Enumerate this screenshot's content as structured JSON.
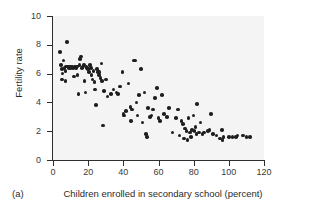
{
  "figure": {
    "panel_label": "(a)",
    "background_color": "#ffffff",
    "plot_background_color": "#f4f4f4",
    "marker_color": "#1f1f1f",
    "axis_color": "#2e2e2e"
  },
  "chart_data": {
    "type": "scatter",
    "title": "",
    "xlabel": "Children enrolled in secondary school (percent)",
    "ylabel": "Fertility rate",
    "xlim": [
      0,
      120
    ],
    "ylim": [
      0,
      10
    ],
    "xticks": [
      0,
      20,
      40,
      60,
      80,
      100,
      120
    ],
    "yticks": [
      0,
      2,
      4,
      6,
      8,
      10
    ],
    "xtick_labels": [
      "0",
      "20",
      "40",
      "60",
      "80",
      "100",
      "120"
    ],
    "ytick_labels": [
      "0",
      "2",
      "4",
      "6",
      "8",
      "10"
    ],
    "grid": false,
    "legend": "none",
    "series": [
      {
        "name": "Countries",
        "points": [
          [
            4.0,
            7.5
          ],
          [
            4.5,
            6.6
          ],
          [
            5.0,
            6.3
          ],
          [
            5.2,
            5.6
          ],
          [
            5.5,
            6.0
          ],
          [
            6.0,
            6.9
          ],
          [
            6.5,
            6.4
          ],
          [
            7.0,
            6.2
          ],
          [
            7.2,
            5.5
          ],
          [
            7.5,
            6.5
          ],
          [
            8.0,
            8.2
          ],
          [
            8.5,
            6.5
          ],
          [
            9.0,
            6.4
          ],
          [
            9.5,
            6.5
          ],
          [
            10.0,
            6.4
          ],
          [
            10.5,
            6.5
          ],
          [
            11.0,
            6.5
          ],
          [
            11.5,
            6.4
          ],
          [
            12.0,
            5.8
          ],
          [
            12.5,
            6.5
          ],
          [
            13.0,
            6.4
          ],
          [
            13.5,
            6.5
          ],
          [
            14.0,
            5.9
          ],
          [
            14.5,
            4.6
          ],
          [
            15.0,
            6.6
          ],
          [
            15.5,
            7.0
          ],
          [
            16.0,
            7.2
          ],
          [
            16.5,
            6.4
          ],
          [
            17.0,
            6.5
          ],
          [
            17.5,
            6.6
          ],
          [
            18.0,
            5.5
          ],
          [
            18.5,
            4.7
          ],
          [
            19.0,
            6.5
          ],
          [
            19.5,
            6.4
          ],
          [
            20.0,
            6.3
          ],
          [
            20.5,
            6.1
          ],
          [
            21.0,
            6.6
          ],
          [
            21.5,
            6.4
          ],
          [
            22.0,
            5.9
          ],
          [
            22.5,
            5.6
          ],
          [
            23.0,
            6.2
          ],
          [
            23.5,
            5.4
          ],
          [
            24.0,
            4.9
          ],
          [
            24.5,
            3.8
          ],
          [
            25.0,
            6.3
          ],
          [
            25.5,
            6.1
          ],
          [
            26.0,
            5.9
          ],
          [
            26.5,
            6.1
          ],
          [
            27.0,
            5.7
          ],
          [
            27.5,
            6.7
          ],
          [
            28.0,
            5.5
          ],
          [
            28.5,
            2.4
          ],
          [
            29.0,
            4.8
          ],
          [
            30.0,
            5.6
          ],
          [
            31.0,
            4.4
          ],
          [
            33.0,
            4.6
          ],
          [
            34.5,
            4.9
          ],
          [
            36.0,
            4.7
          ],
          [
            37.0,
            4.6
          ],
          [
            38.0,
            5.1
          ],
          [
            39.5,
            6.1
          ],
          [
            40.0,
            3.2
          ],
          [
            40.5,
            3.1
          ],
          [
            41.5,
            3.4
          ],
          [
            43.0,
            5.3
          ],
          [
            44.0,
            3.7
          ],
          [
            44.5,
            2.7
          ],
          [
            45.0,
            3.5
          ],
          [
            46.0,
            6.9
          ],
          [
            47.0,
            6.9
          ],
          [
            47.5,
            4.0
          ],
          [
            48.0,
            3.1
          ],
          [
            49.0,
            4.5
          ],
          [
            50.0,
            6.3
          ],
          [
            51.0,
            2.6
          ],
          [
            52.0,
            4.7
          ],
          [
            53.0,
            1.8
          ],
          [
            53.5,
            1.6
          ],
          [
            54.0,
            3.6
          ],
          [
            55.0,
            3.0
          ],
          [
            56.0,
            3.1
          ],
          [
            57.0,
            3.5
          ],
          [
            58.0,
            4.3
          ],
          [
            59.0,
            5.0
          ],
          [
            60.0,
            2.9
          ],
          [
            61.0,
            2.7
          ],
          [
            62.0,
            4.5
          ],
          [
            63.0,
            3.2
          ],
          [
            65.0,
            3.0
          ],
          [
            66.0,
            3.6
          ],
          [
            68.0,
            1.9
          ],
          [
            70.0,
            2.9
          ],
          [
            71.0,
            3.5
          ],
          [
            72.0,
            1.7
          ],
          [
            73.0,
            2.7
          ],
          [
            74.0,
            2.5
          ],
          [
            74.5,
            1.5
          ],
          [
            75.0,
            2.2
          ],
          [
            76.0,
            2.0
          ],
          [
            76.5,
            1.4
          ],
          [
            77.0,
            2.9
          ],
          [
            78.0,
            1.9
          ],
          [
            78.5,
            1.6
          ],
          [
            79.0,
            2.1
          ],
          [
            80.0,
            3.1
          ],
          [
            80.5,
            2.0
          ],
          [
            81.0,
            2.3
          ],
          [
            81.5,
            1.8
          ],
          [
            82.0,
            3.9
          ],
          [
            83.0,
            1.9
          ],
          [
            84.0,
            2.6
          ],
          [
            85.0,
            1.8
          ],
          [
            86.0,
            1.9
          ],
          [
            88.0,
            2.0
          ],
          [
            89.0,
            2.1
          ],
          [
            90.0,
            3.2
          ],
          [
            91.0,
            1.8
          ],
          [
            93.0,
            1.7
          ],
          [
            95.0,
            1.5
          ],
          [
            96.0,
            2.1
          ],
          [
            96.5,
            1.4
          ],
          [
            97.0,
            1.6
          ],
          [
            100.0,
            1.6
          ],
          [
            102.0,
            1.6
          ],
          [
            104.0,
            1.6
          ],
          [
            105.0,
            1.7
          ],
          [
            108.0,
            1.7
          ],
          [
            110.0,
            1.6
          ],
          [
            112.0,
            1.6
          ]
        ]
      }
    ]
  }
}
